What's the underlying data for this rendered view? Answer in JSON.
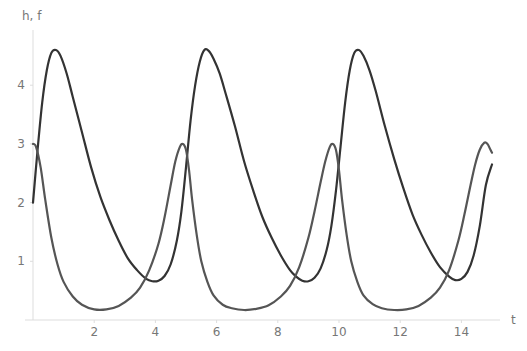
{
  "chart_data": {
    "type": "line",
    "title": "",
    "xlabel": "t",
    "ylabel": "h, f",
    "xlim": [
      0,
      15
    ],
    "ylim": [
      0,
      4.7
    ],
    "grid": false,
    "legend": null,
    "x_ticks": [
      2,
      4,
      6,
      8,
      10,
      12,
      14
    ],
    "y_ticks": [
      1,
      2,
      3,
      4
    ],
    "x_tick_labels": [
      "2",
      "4",
      "6",
      "8",
      "10",
      "12",
      "14"
    ],
    "y_tick_labels": [
      "1",
      "2",
      "3",
      "4"
    ],
    "series": [
      {
        "name": "h",
        "color": "#333333",
        "x": [
          0,
          0.15,
          0.3,
          0.45,
          0.6,
          0.75,
          0.9,
          1.1,
          1.3,
          1.6,
          1.9,
          2.2,
          2.5,
          2.8,
          3.1,
          3.4,
          3.7,
          3.9,
          4.1,
          4.3,
          4.5,
          4.7,
          4.85,
          5.0,
          5.15,
          5.3,
          5.45,
          5.6,
          5.75,
          5.9,
          6.1,
          6.3,
          6.6,
          6.9,
          7.2,
          7.5,
          7.8,
          8.1,
          8.4,
          8.6,
          8.8,
          9.0,
          9.2,
          9.4,
          9.6,
          9.75,
          9.9,
          10.05,
          10.2,
          10.35,
          10.5,
          10.65,
          10.8,
          11.0,
          11.2,
          11.5,
          11.8,
          12.1,
          12.4,
          12.7,
          13.0,
          13.3,
          13.6,
          13.8,
          14.0,
          14.2,
          14.4,
          14.6,
          14.8,
          15.0
        ],
        "y": [
          2.0,
          2.9,
          3.7,
          4.25,
          4.55,
          4.6,
          4.5,
          4.2,
          3.8,
          3.2,
          2.6,
          2.1,
          1.7,
          1.35,
          1.05,
          0.85,
          0.7,
          0.66,
          0.67,
          0.75,
          0.95,
          1.35,
          1.85,
          2.6,
          3.4,
          4.0,
          4.4,
          4.6,
          4.58,
          4.45,
          4.2,
          3.85,
          3.3,
          2.7,
          2.2,
          1.75,
          1.4,
          1.1,
          0.85,
          0.74,
          0.67,
          0.66,
          0.72,
          0.88,
          1.2,
          1.6,
          2.2,
          2.95,
          3.7,
          4.25,
          4.55,
          4.6,
          4.5,
          4.25,
          3.9,
          3.3,
          2.75,
          2.25,
          1.8,
          1.45,
          1.15,
          0.9,
          0.74,
          0.68,
          0.7,
          0.82,
          1.1,
          1.6,
          2.3,
          2.65
        ]
      },
      {
        "name": "f",
        "color": "#555555",
        "x": [
          0,
          0.1,
          0.25,
          0.4,
          0.6,
          0.8,
          1.0,
          1.3,
          1.6,
          2.0,
          2.4,
          2.8,
          3.2,
          3.5,
          3.8,
          4.1,
          4.3,
          4.5,
          4.65,
          4.8,
          4.9,
          5.0,
          5.1,
          5.2,
          5.35,
          5.5,
          5.7,
          5.9,
          6.2,
          6.5,
          6.9,
          7.3,
          7.7,
          8.1,
          8.4,
          8.7,
          9.0,
          9.2,
          9.4,
          9.55,
          9.7,
          9.8,
          9.9,
          10.0,
          10.1,
          10.25,
          10.4,
          10.6,
          10.8,
          11.1,
          11.4,
          11.8,
          12.2,
          12.6,
          13.0,
          13.3,
          13.6,
          13.9,
          14.1,
          14.3,
          14.45,
          14.6,
          14.75,
          14.85,
          14.95,
          15.0
        ],
        "y": [
          3.0,
          2.95,
          2.6,
          2.05,
          1.4,
          0.95,
          0.65,
          0.4,
          0.26,
          0.18,
          0.18,
          0.24,
          0.38,
          0.55,
          0.85,
          1.3,
          1.75,
          2.3,
          2.7,
          2.95,
          3.0,
          2.9,
          2.55,
          2.05,
          1.45,
          1.0,
          0.65,
          0.42,
          0.26,
          0.2,
          0.17,
          0.19,
          0.25,
          0.4,
          0.58,
          0.9,
          1.4,
          1.85,
          2.35,
          2.7,
          2.95,
          3.0,
          2.9,
          2.55,
          2.05,
          1.45,
          1.0,
          0.65,
          0.42,
          0.27,
          0.2,
          0.17,
          0.18,
          0.24,
          0.38,
          0.55,
          0.85,
          1.35,
          1.8,
          2.3,
          2.65,
          2.9,
          3.02,
          3.0,
          2.9,
          2.85
        ]
      }
    ]
  }
}
